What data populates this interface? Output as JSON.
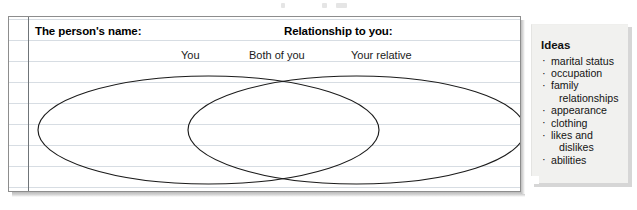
{
  "worksheet": {
    "headings": {
      "person_name": "The person's name:",
      "relationship": "Relationship to you:"
    },
    "venn": {
      "type": "venn-diagram",
      "left_label": "You",
      "center_label": "Both of you",
      "right_label": "Your relative",
      "ruled_line_count": 8
    }
  },
  "note": {
    "title": "Ideas",
    "bullet_glyph": "·",
    "items": [
      {
        "text": "marital status",
        "continuation": ""
      },
      {
        "text": "occupation",
        "continuation": ""
      },
      {
        "text": "family",
        "continuation": "relationships"
      },
      {
        "text": "appearance",
        "continuation": ""
      },
      {
        "text": "clothing",
        "continuation": ""
      },
      {
        "text": "likes and",
        "continuation": "dislikes"
      },
      {
        "text": "abilities",
        "continuation": ""
      }
    ]
  },
  "colors": {
    "paper": "#ffffff",
    "rule_line": "#d7dde3",
    "margin_line": "#6f7478",
    "ink": "#000000",
    "note_paper": "#f1f1ef",
    "note_shadow": "#b4b4b4"
  }
}
